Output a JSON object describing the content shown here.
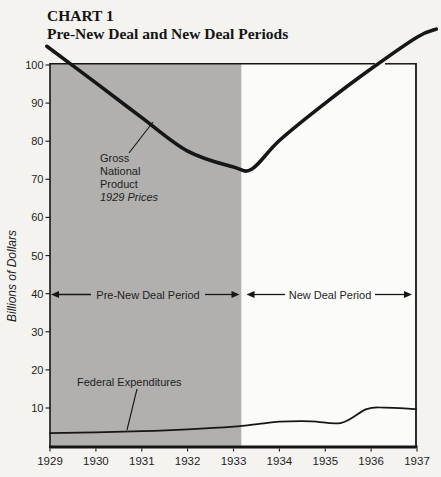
{
  "page": {
    "background": "#f4f3f0"
  },
  "title": {
    "line1": "CHART 1",
    "line2": "Pre-New Deal and New Deal Periods"
  },
  "colors": {
    "line": "#161616",
    "text": "#1e1e1e",
    "shade": "#b1b0ae",
    "plot_bg": "#fbfbf9"
  },
  "chart_data": {
    "type": "line",
    "xlabel": "",
    "ylabel": "Billions of Dollars",
    "xlim": [
      1929,
      1937
    ],
    "ylim": [
      0,
      100
    ],
    "grid": false,
    "x_ticks": [
      "1929",
      "1930",
      "1931",
      "1932",
      "1933",
      "1934",
      "1935",
      "1936",
      "1937"
    ],
    "y_ticks": [
      "10",
      "20",
      "30",
      "40",
      "50",
      "60",
      "70",
      "80",
      "90",
      "100"
    ],
    "series": [
      {
        "name": "Gross National Product (1929 Prices)",
        "x": [
          1928.93,
          1930,
          1931,
          1932,
          1933,
          1933.4,
          1934,
          1935,
          1936,
          1937,
          1937.42
        ],
        "y": [
          104.9,
          95.3,
          86.2,
          77.4,
          73.2,
          72.7,
          80.2,
          90.0,
          99.0,
          107.3,
          109.4
        ],
        "values_by_year": {
          "1929": 104,
          "1930": 95,
          "1931": 86,
          "1932": 77,
          "1933": 73,
          "1934": 80,
          "1935": 90,
          "1936": 99,
          "1937": 107
        },
        "stroke_width": 3.6
      },
      {
        "name": "Federal Expenditures",
        "x": [
          1929,
          1930,
          1931,
          1932,
          1933,
          1933.6,
          1934,
          1934.7,
          1935.35,
          1935.9,
          1936.3,
          1936.98
        ],
        "y": [
          3.4,
          3.6,
          3.9,
          4.4,
          5.1,
          5.9,
          6.4,
          6.5,
          6.1,
          9.7,
          10.1,
          9.7
        ],
        "values_by_year": {
          "1929": 3.4,
          "1930": 3.6,
          "1931": 3.9,
          "1932": 4.4,
          "1933": 5.1,
          "1934": 6.4,
          "1935": 6.3,
          "1936": 9.9,
          "1937": 9.7
        },
        "stroke_width": 1.7
      }
    ],
    "periods": [
      {
        "label": "Pre-New Deal Period",
        "from": 1929,
        "to": 1933.17,
        "shaded": true,
        "shade_color": "#b1b0ae"
      },
      {
        "label": "New Deal Period",
        "from": 1933.17,
        "to": 1937,
        "shaded": false
      }
    ],
    "period_arrows_at_value": 40,
    "annotations": [
      {
        "id": "gnp-label",
        "text_lines": [
          "Gross",
          "National",
          "Product",
          "1929 Prices"
        ],
        "italic_last_line": true
      },
      {
        "id": "fed-label",
        "text": "Federal Expenditures"
      }
    ]
  }
}
